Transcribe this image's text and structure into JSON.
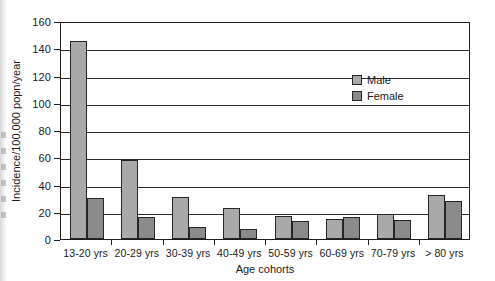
{
  "chart_data": {
    "type": "bar",
    "title": "",
    "subtitle": "",
    "xlabel": "Age cohorts",
    "ylabel": "Incidence/100,000 popn/year",
    "categories": [
      "13-20 yrs",
      "20-29 yrs",
      "30-39 yrs",
      "40-49 yrs",
      "50-59 yrs",
      "60-69 yrs",
      "70-79 yrs",
      "> 80 yrs"
    ],
    "series": [
      {
        "name": "Male",
        "values": [
          145,
          58,
          31,
          23,
          17,
          15,
          18,
          32
        ],
        "color": "#a9a9a9"
      },
      {
        "name": "Female",
        "values": [
          30,
          16,
          9,
          7,
          13,
          16,
          14,
          28
        ],
        "color": "#8b8b8b"
      }
    ],
    "ylim": [
      0,
      160
    ],
    "yticks": [
      0,
      20,
      40,
      60,
      80,
      100,
      120,
      140,
      160
    ],
    "ytick_labels": [
      "0",
      "20",
      "40",
      "60",
      "80",
      "100",
      "120",
      "140",
      "160"
    ],
    "grid": true,
    "grid_axis": "y",
    "legend_position": "upper-right-inside",
    "legend_entries": [
      "Male",
      "Female"
    ]
  },
  "legend": {
    "items": [
      {
        "label": "Male"
      },
      {
        "label": "Female"
      }
    ]
  },
  "axes": {
    "y_title": "Incidence/100,000 popn/year",
    "x_title": "Age cohorts"
  },
  "colors": {
    "male_bar": "#a9a9a9",
    "female_bar": "#8b8b8b",
    "axis": "#1e1e1e",
    "grid": "#2b2b2b",
    "background": "#ffffff"
  }
}
